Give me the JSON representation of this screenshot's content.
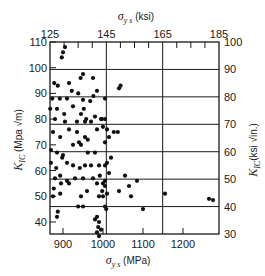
{
  "chart_data": {
    "type": "scatter",
    "title": "",
    "xlabel": "σ_ys (MPa)",
    "x2label": "σ_ys (ksi)",
    "ylabel": "K_IC (Mpa √m)",
    "y2label": "K_IC (ksi √in.)",
    "xlim": [
      867,
      1282
    ],
    "ylim": [
      33,
      110
    ],
    "x2lim": [
      125,
      185
    ],
    "y2lim": [
      30,
      100
    ],
    "grid": true,
    "legend": null,
    "x_ticks": [
      900,
      1000,
      1100,
      1200
    ],
    "x_tick_labels": [
      "900",
      "1000",
      "1100",
      "1200"
    ],
    "y_ticks": [
      40,
      50,
      60,
      70,
      80,
      90,
      100,
      110
    ],
    "y_tick_labels": [
      "40",
      "50",
      "60",
      "70",
      "80",
      "90",
      "100",
      "110"
    ],
    "x2_ticks": [
      125,
      145,
      165,
      185
    ],
    "x2_tick_labels": [
      "125",
      "145",
      "165",
      "185"
    ],
    "y2_ticks": [
      30,
      40,
      50,
      60,
      70,
      80,
      90,
      100
    ],
    "y2_tick_labels": [
      "30",
      "40",
      "50",
      "60",
      "70",
      "80",
      "90",
      "100"
    ],
    "series": [
      {
        "name": "data",
        "points": [
          [
            905,
            108
          ],
          [
            900,
            106
          ],
          [
            897,
            104
          ],
          [
            878,
            94
          ],
          [
            887,
            93
          ],
          [
            915,
            94
          ],
          [
            922,
            91
          ],
          [
            944,
            96
          ],
          [
            950,
            97.5
          ],
          [
            938,
            90
          ],
          [
            975,
            96
          ],
          [
            976,
            89
          ],
          [
            873,
            88
          ],
          [
            892,
            88
          ],
          [
            910,
            88
          ],
          [
            950,
            87.5
          ],
          [
            968,
            87
          ],
          [
            985,
            91
          ],
          [
            1005,
            88
          ],
          [
            1040,
            92
          ],
          [
            1044,
            93
          ],
          [
            868,
            84
          ],
          [
            885,
            84
          ],
          [
            903,
            82
          ],
          [
            925,
            85
          ],
          [
            945,
            82
          ],
          [
            952,
            84
          ],
          [
            958,
            80
          ],
          [
            980,
            81
          ],
          [
            995,
            80
          ],
          [
            880,
            80
          ],
          [
            905,
            79
          ],
          [
            935,
            79
          ],
          [
            955,
            79
          ],
          [
            970,
            79
          ],
          [
            997,
            80
          ],
          [
            1005,
            80
          ],
          [
            875,
            75
          ],
          [
            893,
            73
          ],
          [
            915,
            76
          ],
          [
            935,
            75
          ],
          [
            940,
            71
          ],
          [
            955,
            73
          ],
          [
            962,
            72
          ],
          [
            985,
            76
          ],
          [
            1000,
            77
          ],
          [
            1010,
            76
          ],
          [
            1027,
            75
          ],
          [
            1037,
            75
          ],
          [
            870,
            68
          ],
          [
            885,
            67
          ],
          [
            900,
            66
          ],
          [
            925,
            70
          ],
          [
            945,
            70
          ],
          [
            962,
            67
          ],
          [
            980,
            67
          ],
          [
            1005,
            71
          ],
          [
            1015,
            73
          ],
          [
            870,
            63
          ],
          [
            883,
            61
          ],
          [
            898,
            65
          ],
          [
            910,
            63
          ],
          [
            925,
            62
          ],
          [
            942,
            61
          ],
          [
            955,
            62
          ],
          [
            970,
            62
          ],
          [
            990,
            62
          ],
          [
            1005,
            62
          ],
          [
            1010,
            63
          ],
          [
            1020,
            65
          ],
          [
            880,
            57
          ],
          [
            893,
            58
          ],
          [
            910,
            56
          ],
          [
            930,
            57
          ],
          [
            950,
            57
          ],
          [
            975,
            57
          ],
          [
            992,
            58
          ],
          [
            1000,
            55
          ],
          [
            1005,
            56
          ],
          [
            1015,
            59
          ],
          [
            1055,
            58
          ],
          [
            877,
            53
          ],
          [
            895,
            55
          ],
          [
            915,
            55
          ],
          [
            960,
            52
          ],
          [
            985,
            55
          ],
          [
            998,
            52
          ],
          [
            1005,
            54
          ],
          [
            1040,
            52
          ],
          [
            1065,
            54
          ],
          [
            1070,
            50
          ],
          [
            1085,
            56
          ],
          [
            875,
            50
          ],
          [
            893,
            51
          ],
          [
            945,
            50
          ],
          [
            990,
            50
          ],
          [
            1000,
            50
          ],
          [
            1010,
            51
          ],
          [
            1100,
            45
          ],
          [
            1155,
            51
          ],
          [
            1265,
            49
          ],
          [
            1275,
            48.5
          ],
          [
            887,
            44
          ],
          [
            885,
            42
          ],
          [
            938,
            46
          ],
          [
            950,
            46
          ],
          [
            980,
            41
          ],
          [
            985,
            42
          ],
          [
            990,
            40
          ],
          [
            988,
            38
          ],
          [
            985,
            36
          ],
          [
            990,
            34.5
          ],
          [
            995,
            37
          ],
          [
            1005,
            46
          ],
          [
            1008,
            45
          ]
        ]
      }
    ],
    "annotations": []
  }
}
